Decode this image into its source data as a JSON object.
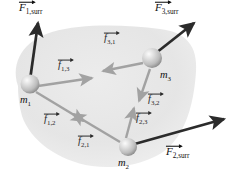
{
  "figure": {
    "colors": {
      "background": "#ffffff",
      "system_blob_fill": "#e3e3e3",
      "system_blob_fill_edge": "#efefef",
      "external_force_arrow": "#2b2b2b",
      "internal_force_arrow": "#9a9a9a",
      "sphere_highlight": "#f2f2f2",
      "sphere_mid": "#c9c9c9",
      "sphere_shadow": "#8f8f8f",
      "label_text": "#111111"
    }
  },
  "particles": [
    {
      "id": "m1",
      "label_italic": "m",
      "label_sub": "1",
      "cx": 30,
      "cy": 84,
      "r": 9.5
    },
    {
      "id": "m2",
      "label_italic": "m",
      "label_sub": "2",
      "cx": 128,
      "cy": 147,
      "r": 9.0
    },
    {
      "id": "m3",
      "label_italic": "m",
      "label_sub": "3",
      "cx": 152,
      "cy": 58,
      "r": 10.0
    }
  ],
  "external_forces": [
    {
      "id": "F1surr",
      "symbol": "F",
      "subscript": "1,surr",
      "kind": "external",
      "on_particle": "m1",
      "x1": 30,
      "y1": 80,
      "x2": 38,
      "y2": 23,
      "label_x": 19,
      "label_y": 2
    },
    {
      "id": "F3surr",
      "symbol": "F",
      "subscript": "3,surr",
      "kind": "external",
      "on_particle": "m3",
      "x1": 156,
      "y1": 53,
      "x2": 194,
      "y2": 23,
      "label_x": 155,
      "label_y": 2
    },
    {
      "id": "F2surr",
      "symbol": "F",
      "subscript": "2,surr",
      "kind": "external",
      "on_particle": "m2",
      "x1": 131,
      "y1": 145,
      "x2": 224,
      "y2": 119,
      "label_x": 166,
      "label_y": 146
    }
  ],
  "internal_forces": [
    {
      "id": "f13",
      "symbol": "f",
      "subscript": "1,3",
      "kind": "internal",
      "on_particle": "m1",
      "toward": "m3",
      "x1": 38,
      "y1": 86,
      "x2": 92,
      "y2": 78,
      "label_x": 58,
      "label_y": 60
    },
    {
      "id": "f31",
      "symbol": "f",
      "subscript": "3,1",
      "kind": "internal",
      "on_particle": "m3",
      "toward": "m1",
      "x1": 143,
      "y1": 63,
      "x2": 103,
      "y2": 71,
      "label_x": 104,
      "label_y": 33
    },
    {
      "id": "f12",
      "symbol": "f",
      "subscript": "1,2",
      "kind": "internal",
      "on_particle": "m1",
      "toward": "m2",
      "x1": 36,
      "y1": 92,
      "x2": 84,
      "y2": 121,
      "label_x": 44,
      "label_y": 114
    },
    {
      "id": "f21",
      "symbol": "f",
      "subscript": "2,1",
      "kind": "internal",
      "on_particle": "m2",
      "toward": "m1",
      "x1": 120,
      "y1": 142,
      "x2": 73,
      "y2": 114,
      "label_x": 78,
      "label_y": 136
    },
    {
      "id": "f32",
      "symbol": "f",
      "subscript": "3,2",
      "kind": "internal",
      "on_particle": "m3",
      "toward": "m2",
      "x1": 150,
      "y1": 69,
      "x2": 139,
      "y2": 101,
      "label_x": 148,
      "label_y": 94
    },
    {
      "id": "f23",
      "symbol": "f",
      "subscript": "2,3",
      "kind": "internal",
      "on_particle": "m2",
      "toward": "m3",
      "x1": 126,
      "y1": 138,
      "x2": 134,
      "y2": 108,
      "label_x": 136,
      "label_y": 113
    }
  ],
  "mass_labels": [
    {
      "id": "m1",
      "x": 20,
      "y": 95
    },
    {
      "id": "m2",
      "x": 118,
      "y": 158
    },
    {
      "id": "m3",
      "x": 160,
      "y": 70
    }
  ]
}
